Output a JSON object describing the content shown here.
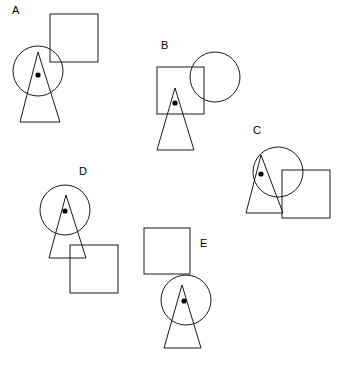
{
  "canvas": {
    "width": 344,
    "height": 367,
    "background": "#ffffff",
    "stroke_color": "#1a1a1a",
    "stroke_width": 1,
    "dot_color": "#000000",
    "label_color": "#000000",
    "label_font_size": 11
  },
  "figures": [
    {
      "id": "A",
      "label": "A",
      "label_x": 12,
      "label_y": 14,
      "circle": {
        "cx": 38,
        "cy": 71,
        "r": 25
      },
      "square": {
        "x": 50,
        "y": 14,
        "size": 48
      },
      "triangle": {
        "apex_x": 38,
        "apex_y": 52,
        "base_y": 122,
        "base_left_x": 20,
        "base_right_x": 60
      },
      "dot": {
        "cx": 38,
        "cy": 75,
        "r": 2.6
      }
    },
    {
      "id": "B",
      "label": "B",
      "label_x": 161,
      "label_y": 49,
      "circle": {
        "cx": 215,
        "cy": 77,
        "r": 25
      },
      "square": {
        "x": 157,
        "y": 67,
        "size": 47
      },
      "triangle": {
        "apex_x": 175,
        "apex_y": 88,
        "base_y": 150,
        "base_left_x": 157,
        "base_right_x": 194
      },
      "dot": {
        "cx": 175,
        "cy": 103,
        "r": 2.6
      }
    },
    {
      "id": "C",
      "label": "C",
      "label_x": 253,
      "label_y": 134,
      "circle": {
        "cx": 278,
        "cy": 172,
        "r": 25
      },
      "square": {
        "x": 282,
        "y": 170,
        "size": 48
      },
      "triangle": {
        "apex_x": 261,
        "apex_y": 155,
        "base_y": 213,
        "base_left_x": 246,
        "base_right_x": 283
      },
      "dot": {
        "cx": 261,
        "cy": 174,
        "r": 2.6
      }
    },
    {
      "id": "D",
      "label": "D",
      "label_x": 79,
      "label_y": 175,
      "circle": {
        "cx": 65,
        "cy": 210,
        "r": 25
      },
      "square": {
        "x": 70,
        "y": 245,
        "size": 48
      },
      "triangle": {
        "apex_x": 66,
        "apex_y": 195,
        "base_y": 258,
        "base_left_x": 49,
        "base_right_x": 86
      },
      "dot": {
        "cx": 65,
        "cy": 211,
        "r": 2.6
      }
    },
    {
      "id": "E",
      "label": "E",
      "label_x": 200,
      "label_y": 247,
      "circle": {
        "cx": 186,
        "cy": 300,
        "r": 25
      },
      "square": {
        "x": 144,
        "y": 228,
        "size": 46
      },
      "triangle": {
        "apex_x": 182,
        "apex_y": 285,
        "base_y": 348,
        "base_left_x": 164,
        "base_right_x": 201
      },
      "dot": {
        "cx": 184,
        "cy": 301,
        "r": 2.6
      }
    }
  ]
}
